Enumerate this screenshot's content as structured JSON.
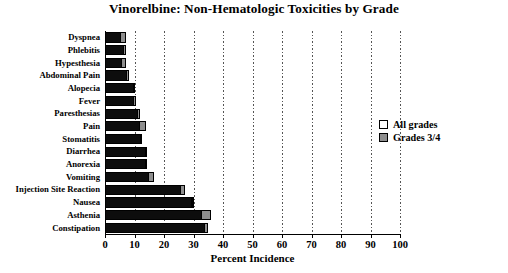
{
  "chart_data": {
    "type": "bar",
    "orientation": "horizontal",
    "title": "Vinorelbine: Non-Hematologic Toxicities by Grade",
    "xlabel": "Percent Incidence",
    "ylabel": "",
    "xlim": [
      0,
      100
    ],
    "xticks": [
      0,
      10,
      20,
      30,
      40,
      50,
      60,
      70,
      80,
      90,
      100
    ],
    "xtick_labels": [
      "0",
      "10",
      "20",
      "30",
      "40",
      "50",
      "60",
      "70",
      "80",
      "90",
      "100"
    ],
    "grid": true,
    "grid_axis": "x",
    "grid_style": "dotted",
    "legend_position": "right",
    "categories": [
      "Dyspnea",
      "Phlebitis",
      "Hypesthesia",
      "Abdominal Pain",
      "Alopecia",
      "Fever",
      "Paresthesias",
      "Pain",
      "Stomatitis",
      "Diarrhea",
      "Anorexia",
      "Vomiting",
      "Injection Site Reaction",
      "Nausea",
      "Asthenia",
      "Constipation"
    ],
    "series": [
      {
        "name": "All grades",
        "color": "#0d0d0d",
        "values": [
          7,
          7,
          7,
          8,
          10,
          10.5,
          12,
          14,
          12.5,
          14,
          14,
          16.5,
          27,
          30,
          36,
          35
        ]
      },
      {
        "name": "Grades 3/4",
        "color": "#8e8e8e",
        "values": [
          2,
          1,
          1.5,
          1,
          0.5,
          1,
          1,
          2.5,
          0.5,
          0.5,
          0.5,
          2,
          1.5,
          1,
          3.5,
          1.5
        ]
      }
    ],
    "note": "Each row shows the All-grades bar; the shaded Grades 3/4 portion occupies the right-hand end of the same bar."
  },
  "legend": {
    "items": [
      {
        "label": "All grades",
        "swatch": "open-square-white"
      },
      {
        "label": "Grades 3/4",
        "swatch": "filled-square-gray"
      }
    ]
  },
  "colors": {
    "all_grades": "#0d0d0d",
    "grades_34": "#8e8e8e",
    "axis": "#000000",
    "background": "#ffffff"
  }
}
